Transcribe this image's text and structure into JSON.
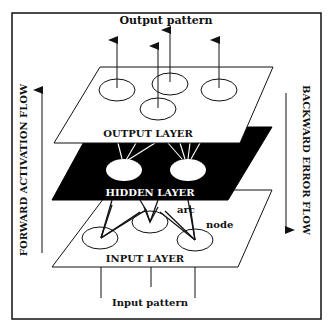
{
  "diagram": {
    "title_top": "Output pattern",
    "title_bottom": "Input pattern",
    "left_flow_label": "FORWARD ACTIVATION FLOW",
    "right_flow_label": "BACKWARD ERROR FLOW",
    "layers": {
      "output": {
        "label": "OUTPUT  LAYER",
        "fill": "#ffffff",
        "node_count": 4
      },
      "hidden": {
        "label": "HIDDEN  LAYER",
        "fill": "#000000",
        "node_count": 2
      },
      "input": {
        "label": "INPUT LAYER",
        "fill": "#ffffff",
        "node_count": 3
      }
    },
    "annotations": {
      "arc": "arc",
      "node": "node"
    },
    "colors": {
      "ink": "#111111",
      "background": "#ffffff"
    }
  }
}
